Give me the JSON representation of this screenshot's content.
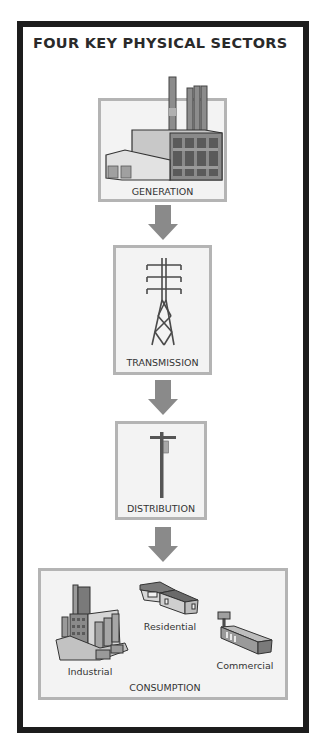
{
  "title": "FOUR KEY PHYSICAL SECTORS",
  "colors": {
    "frame": "#1d1d1d",
    "box_border": "#b4b4b4",
    "box_fill": "#f3f3f3",
    "arrow": "#8a8a8a",
    "icon_dark": "#5a5a5a",
    "icon_mid": "#8c8c8c",
    "icon_light": "#cfcfcf"
  },
  "sectors": [
    {
      "label": "GENERATION",
      "icon": "power-plant-icon"
    },
    {
      "label": "TRANSMISSION",
      "icon": "transmission-tower-icon"
    },
    {
      "label": "DISTRIBUTION",
      "icon": "utility-pole-icon"
    },
    {
      "label": "CONSUMPTION",
      "icon": "consumers-icon",
      "subsectors": [
        {
          "label": "Industrial",
          "icon": "industrial-plant-icon"
        },
        {
          "label": "Residential",
          "icon": "house-icon"
        },
        {
          "label": "Commercial",
          "icon": "commercial-building-icon"
        }
      ]
    }
  ],
  "flow_arrows": [
    "down-arrow-icon",
    "down-arrow-icon",
    "down-arrow-icon"
  ]
}
